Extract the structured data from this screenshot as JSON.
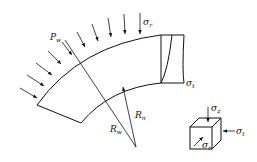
{
  "diagram": {
    "labels": {
      "pressure": {
        "main": "P",
        "sub": "w"
      },
      "sigma_r_top": {
        "main": "σ",
        "sub": "r"
      },
      "sigma_t_right": {
        "main": "σ",
        "sub": "t"
      },
      "outer_radius": {
        "main": "R",
        "sub": "w"
      },
      "inner_radius": {
        "main": "R",
        "sub": "n"
      },
      "cube_sigma_z": {
        "main": "σ",
        "sub": "z"
      },
      "cube_sigma_t": {
        "main": "σ",
        "sub": "t"
      },
      "cube_sigma_r": {
        "main": "σ",
        "sub": "r"
      }
    },
    "line_color": "#111111",
    "background": "#ffffff"
  }
}
